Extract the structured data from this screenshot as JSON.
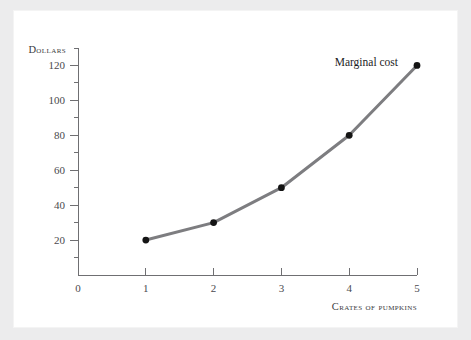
{
  "chart_data": {
    "type": "line",
    "title": "",
    "xlabel": "Crates of pumpkins",
    "ylabel": "Dollars",
    "x": [
      1,
      2,
      3,
      4,
      5
    ],
    "values": [
      20,
      30,
      50,
      80,
      120
    ],
    "series": [
      {
        "name": "Marginal cost",
        "x": [
          1,
          2,
          3,
          4,
          5
        ],
        "values": [
          20,
          30,
          50,
          80,
          120
        ],
        "line_color": "#7d7d80",
        "marker_color": "#141414"
      }
    ],
    "annotations": [
      {
        "text": "Marginal cost",
        "x": 4.72,
        "y": 122
      }
    ],
    "xlim": [
      0,
      5
    ],
    "ylim": [
      0,
      130
    ],
    "x_ticks": [
      0,
      1,
      2,
      3,
      4,
      5
    ],
    "x_tick_labels": [
      "0",
      "1",
      "2",
      "3",
      "4",
      "5"
    ],
    "y_ticks": [
      20,
      40,
      60,
      80,
      100,
      120
    ],
    "y_tick_labels": [
      "20",
      "40",
      "60",
      "80",
      "100",
      "120"
    ],
    "y_minor_ticks": [
      10,
      30,
      50,
      70,
      90,
      110,
      130
    ],
    "grid": false,
    "legend": "none",
    "background_color": "#ffffff",
    "page_background_color": "#ececed",
    "axis_color": "#6f6f72"
  }
}
